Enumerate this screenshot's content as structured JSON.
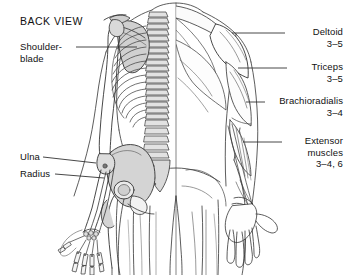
{
  "diagram": {
    "title": "BACK VIEW",
    "type": "anatomy-back-view-skeleton-muscle",
    "background_color": "#ffffff",
    "line_color": "#333333",
    "bone_fill_color": "#d9d9d9",
    "text_color": "#111111"
  },
  "labels_left": [
    {
      "name": "shoulder-blade",
      "text": "Shoulder-\nblade",
      "x": 20,
      "y": 42
    },
    {
      "name": "ulna",
      "text": "Ulna",
      "x": 20,
      "y": 152
    },
    {
      "name": "radius",
      "text": "Radius",
      "x": 20,
      "y": 169
    }
  ],
  "labels_right": [
    {
      "name": "deltoid",
      "text": "Deltoid\n3–5",
      "right": 8,
      "y": 27
    },
    {
      "name": "triceps",
      "text": "Triceps\n3–5",
      "right": 8,
      "y": 62
    },
    {
      "name": "brachioradialis",
      "text": "Brachioradialis\n3–4",
      "right": 8,
      "y": 96
    },
    {
      "name": "extensor-muscles",
      "text": "Extensor\nmuscles\n3–4, 6",
      "right": 8,
      "y": 136
    }
  ],
  "muscle_reps": {
    "deltoid": "3–5",
    "triceps": "3–5",
    "brachioradialis": "3–4",
    "extensor_muscles": "3–4, 6"
  }
}
